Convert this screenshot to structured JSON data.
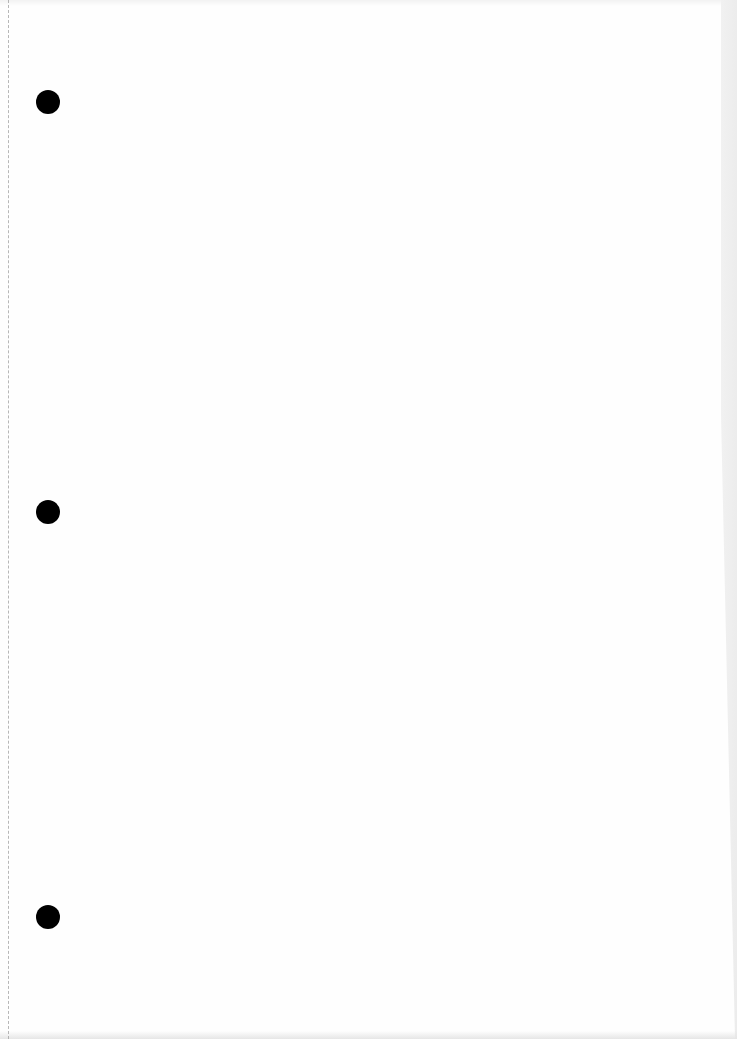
{
  "page": {
    "type": "blank scanned sheet",
    "background_color": "#fefefe",
    "text_content": ""
  },
  "punch_holes": [
    {
      "cx": 48,
      "cy": 102,
      "diameter": 24,
      "color": "#000000"
    },
    {
      "cx": 48,
      "cy": 512,
      "diameter": 24,
      "color": "#000000"
    },
    {
      "cx": 48,
      "cy": 917,
      "diameter": 24,
      "color": "#000000"
    }
  ],
  "perforation": {
    "x": 8,
    "style": "dashed",
    "color": "#9a9a9a"
  }
}
